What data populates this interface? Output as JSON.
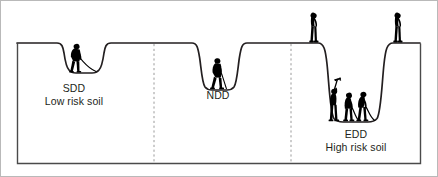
{
  "figure": {
    "frame_color": "#b9b9b9",
    "line_color": "#231f20",
    "figure_color": "#000000",
    "divider_color": "#9a9a9a",
    "background": "#ffffff",
    "ground_line_label": "ground-surface-profile"
  },
  "sections": [
    {
      "id": "sdd",
      "code": "SDD",
      "risk": "Low risk soil",
      "workers_in_trench": 1,
      "workers_on_edge": 0,
      "trench_depth_label": "shallow"
    },
    {
      "id": "ndd",
      "code": "NDD",
      "risk": "",
      "workers_in_trench": 1,
      "workers_on_edge": 0,
      "trench_depth_label": "normal"
    },
    {
      "id": "edd",
      "code": "EDD",
      "risk": "High risk soil",
      "workers_in_trench": 3,
      "workers_on_edge": 2,
      "trench_depth_label": "extra deep"
    }
  ],
  "dividers": [
    {
      "name": "divider-sdd-ndd",
      "x": 154
    },
    {
      "name": "divider-ndd-edd",
      "x": 291
    }
  ]
}
